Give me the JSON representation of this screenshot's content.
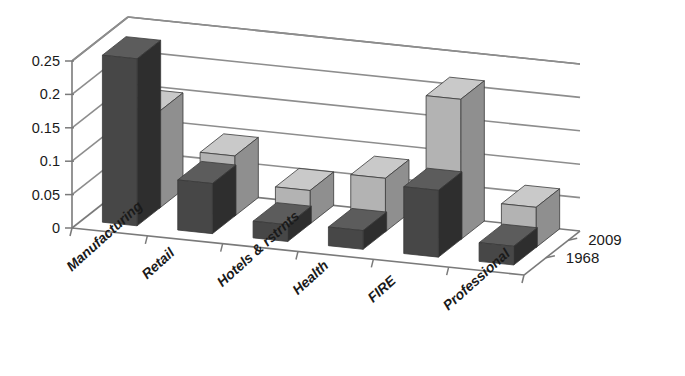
{
  "chart_data": {
    "type": "bar",
    "title": "",
    "subtitle": "",
    "xlabel": "",
    "ylabel": "",
    "categories": [
      "Manufacturing",
      "Retail",
      "Hotels & rstrnts",
      "Health",
      "FIRE",
      "Professional"
    ],
    "series": [
      {
        "name": "2009",
        "values": [
          0.145,
          0.09,
          0.05,
          0.08,
          0.21,
          0.06
        ],
        "color": "#b3b3b3",
        "row": "back"
      },
      {
        "name": "1968",
        "values": [
          0.25,
          0.075,
          0.025,
          0.028,
          0.1,
          0.028
        ],
        "color": "#474747",
        "row": "front"
      }
    ],
    "ylim": [
      0,
      0.25
    ],
    "ytick_values": [
      0,
      0.05,
      0.1,
      0.15,
      0.2,
      0.25
    ],
    "ytick_labels": [
      "0",
      "0.05",
      "0.1",
      "0.15",
      "0.2",
      "0.25"
    ],
    "grid": true,
    "legend_position": "right-depth-axis",
    "three_d": true,
    "annotations": []
  },
  "axis": {
    "y_ticks": [
      {
        "label": "0.25",
        "value": 0.25
      },
      {
        "label": "0.2",
        "value": 0.2
      },
      {
        "label": "0.15",
        "value": 0.15
      },
      {
        "label": "0.1",
        "value": 0.1
      },
      {
        "label": "0.05",
        "value": 0.05
      },
      {
        "label": "0",
        "value": 0
      }
    ],
    "categories": [
      {
        "label": "Manufacturing"
      },
      {
        "label": "Retail"
      },
      {
        "label": "Hotels & rstrnts"
      },
      {
        "label": "Health"
      },
      {
        "label": "FIRE"
      },
      {
        "label": "Professional"
      }
    ],
    "depth_series": [
      {
        "label": "2009"
      },
      {
        "label": "1968"
      }
    ]
  },
  "colors": {
    "series_2009": "#b3b3b3",
    "series_2009_side": "#8f8f8f",
    "series_2009_top": "#c9c9c9",
    "series_1968": "#474747",
    "series_1968_side": "#2e2e2e",
    "series_1968_top": "#5c5c5c",
    "grid": "#8d8d8d",
    "axis": "#7a7a7a",
    "text": "#1a1a1a",
    "background": "#ffffff"
  }
}
